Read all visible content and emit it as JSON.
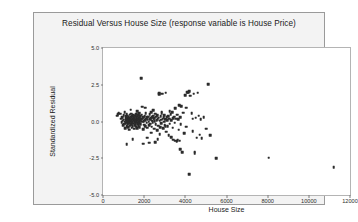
{
  "chart_data": {
    "type": "scatter",
    "title": "Residual Versus House Size (response variable is House Price)",
    "xlabel": "House Size",
    "ylabel": "Standardized Residual",
    "xlim": [
      0,
      12000
    ],
    "ylim": [
      -5.0,
      5.0
    ],
    "xticks": [
      0,
      2000,
      4000,
      6000,
      8000,
      10000,
      12000
    ],
    "xtick_labels": [
      "0",
      "2000",
      "4000",
      "6000",
      "8000",
      "10000",
      "12000"
    ],
    "yticks": [
      5.0,
      2.5,
      0.0,
      -2.5,
      -5.0
    ],
    "ytick_labels": [
      "5.0",
      "2.5",
      "0.0",
      "-2.5",
      "-5.0"
    ],
    "grid": false,
    "legend": null,
    "marker_color": "#2b2b2b",
    "marker_size_px": 2.6,
    "points": [
      [
        760,
        0.55
      ],
      [
        830,
        0.52
      ],
      [
        880,
        0.18
      ],
      [
        900,
        -0.05
      ],
      [
        940,
        0.3
      ],
      [
        960,
        0.05
      ],
      [
        980,
        -0.25
      ],
      [
        1000,
        0.42
      ],
      [
        1010,
        0.12
      ],
      [
        1030,
        -0.15
      ],
      [
        1050,
        0.62
      ],
      [
        1060,
        0.0
      ],
      [
        1080,
        -0.45
      ],
      [
        1100,
        0.22
      ],
      [
        1110,
        -0.1
      ],
      [
        1120,
        0.35
      ],
      [
        1140,
        0.08
      ],
      [
        1150,
        -0.3
      ],
      [
        1160,
        0.48
      ],
      [
        1170,
        0.15
      ],
      [
        1180,
        -0.05
      ],
      [
        1190,
        0.25
      ],
      [
        1200,
        -0.2
      ],
      [
        1210,
        0.4
      ],
      [
        1220,
        0.02
      ],
      [
        1230,
        -0.38
      ],
      [
        1240,
        0.18
      ],
      [
        1250,
        0.3
      ],
      [
        1260,
        -0.12
      ],
      [
        1270,
        0.08
      ],
      [
        1280,
        -0.55
      ],
      [
        1290,
        0.22
      ],
      [
        1300,
        0.45
      ],
      [
        1310,
        -0.02
      ],
      [
        1320,
        0.15
      ],
      [
        1330,
        -0.28
      ],
      [
        1340,
        0.33
      ],
      [
        1350,
        0.05
      ],
      [
        1360,
        -0.18
      ],
      [
        1370,
        0.52
      ],
      [
        1380,
        0.1
      ],
      [
        1390,
        -0.42
      ],
      [
        1400,
        0.28
      ],
      [
        1410,
        0.0
      ],
      [
        1420,
        0.38
      ],
      [
        1430,
        -0.08
      ],
      [
        1440,
        0.2
      ],
      [
        1450,
        -0.33
      ],
      [
        1460,
        0.12
      ],
      [
        1470,
        0.44
      ],
      [
        1480,
        -0.15
      ],
      [
        1490,
        0.06
      ],
      [
        1500,
        0.3
      ],
      [
        1510,
        -0.5
      ],
      [
        1520,
        0.16
      ],
      [
        1530,
        0.4
      ],
      [
        1540,
        -0.05
      ],
      [
        1550,
        0.24
      ],
      [
        1560,
        -0.25
      ],
      [
        1570,
        0.1
      ],
      [
        1580,
        0.35
      ],
      [
        1590,
        -0.12
      ],
      [
        1600,
        0.02
      ],
      [
        1610,
        0.5
      ],
      [
        1620,
        -0.35
      ],
      [
        1630,
        0.18
      ],
      [
        1640,
        0.28
      ],
      [
        1650,
        -0.08
      ],
      [
        1660,
        0.12
      ],
      [
        1670,
        -0.45
      ],
      [
        1680,
        0.32
      ],
      [
        1690,
        0.05
      ],
      [
        1700,
        -0.2
      ],
      [
        1710,
        0.42
      ],
      [
        1720,
        0.14
      ],
      [
        1730,
        -0.3
      ],
      [
        1740,
        0.22
      ],
      [
        1750,
        0.0
      ],
      [
        1760,
        0.55
      ],
      [
        1770,
        -0.1
      ],
      [
        1780,
        0.26
      ],
      [
        1790,
        -0.4
      ],
      [
        1800,
        0.08
      ],
      [
        1820,
        0.36
      ],
      [
        1840,
        -0.18
      ],
      [
        1860,
        0.16
      ],
      [
        1880,
        0.46
      ],
      [
        1900,
        -0.02
      ],
      [
        1920,
        0.2
      ],
      [
        1940,
        -0.52
      ],
      [
        1960,
        0.3
      ],
      [
        1980,
        0.04
      ],
      [
        2000,
        -0.22
      ],
      [
        2020,
        0.38
      ],
      [
        2040,
        0.1
      ],
      [
        2060,
        -0.3
      ],
      [
        2080,
        0.58
      ],
      [
        2100,
        0.18
      ],
      [
        2120,
        -0.08
      ],
      [
        2140,
        0.28
      ],
      [
        2160,
        -0.42
      ],
      [
        2180,
        0.12
      ],
      [
        2200,
        0.34
      ],
      [
        2220,
        0.0
      ],
      [
        2240,
        -0.25
      ],
      [
        2260,
        0.48
      ],
      [
        2280,
        0.14
      ],
      [
        2300,
        -0.15
      ],
      [
        2320,
        0.24
      ],
      [
        2340,
        0.62
      ],
      [
        2360,
        -0.35
      ],
      [
        2380,
        0.06
      ],
      [
        2400,
        0.3
      ],
      [
        2420,
        -0.05
      ],
      [
        2440,
        0.4
      ],
      [
        2460,
        0.18
      ],
      [
        2480,
        -0.48
      ],
      [
        2500,
        0.22
      ],
      [
        2520,
        0.02
      ],
      [
        2540,
        0.52
      ],
      [
        2560,
        -0.2
      ],
      [
        2580,
        0.32
      ],
      [
        2600,
        0.1
      ],
      [
        2620,
        -0.6
      ],
      [
        2640,
        0.44
      ],
      [
        2660,
        0.15
      ],
      [
        2680,
        -0.28
      ],
      [
        2700,
        0.26
      ],
      [
        2720,
        1.85
      ],
      [
        2740,
        1.92
      ],
      [
        2760,
        0.05
      ],
      [
        2780,
        -0.38
      ],
      [
        2800,
        0.36
      ],
      [
        2820,
        0.12
      ],
      [
        2840,
        -0.1
      ],
      [
        2860,
        0.55
      ],
      [
        2880,
        1.9
      ],
      [
        2900,
        0.2
      ],
      [
        2920,
        -0.45
      ],
      [
        2940,
        0.3
      ],
      [
        2960,
        0.0
      ],
      [
        2980,
        0.42
      ],
      [
        3000,
        -0.25
      ],
      [
        3020,
        0.16
      ],
      [
        3050,
        1.95
      ],
      [
        3080,
        -0.7
      ],
      [
        3100,
        0.28
      ],
      [
        3120,
        0.08
      ],
      [
        3150,
        -0.32
      ],
      [
        3180,
        0.38
      ],
      [
        3200,
        -0.95
      ],
      [
        3220,
        0.18
      ],
      [
        3250,
        -0.15
      ],
      [
        3280,
        0.48
      ],
      [
        3300,
        -1.05
      ],
      [
        3320,
        0.1
      ],
      [
        3350,
        0.62
      ],
      [
        3380,
        -0.42
      ],
      [
        3400,
        0.24
      ],
      [
        3420,
        -1.25
      ],
      [
        3450,
        0.34
      ],
      [
        3480,
        -0.08
      ],
      [
        3500,
        0.9
      ],
      [
        3520,
        -1.3
      ],
      [
        3550,
        0.2
      ],
      [
        3580,
        -1.35
      ],
      [
        3600,
        0.45
      ],
      [
        3620,
        -1.28
      ],
      [
        3650,
        0.14
      ],
      [
        3680,
        -0.55
      ],
      [
        3700,
        1.1
      ],
      [
        3720,
        -1.32
      ],
      [
        3750,
        0.3
      ],
      [
        3780,
        -0.2
      ],
      [
        3800,
        1.05
      ],
      [
        3850,
        -2.1
      ],
      [
        3900,
        0.6
      ],
      [
        3950,
        -0.8
      ],
      [
        4000,
        1.8
      ],
      [
        4050,
        -0.35
      ],
      [
        4100,
        2.0
      ],
      [
        4150,
        1.95
      ],
      [
        4180,
        2.05
      ],
      [
        4200,
        -3.6
      ],
      [
        4250,
        1.75
      ],
      [
        4300,
        0.55
      ],
      [
        4350,
        -0.65
      ],
      [
        4400,
        1.9
      ],
      [
        4450,
        -2.05
      ],
      [
        4500,
        0.25
      ],
      [
        4550,
        -1.1
      ],
      [
        4600,
        1.95
      ],
      [
        4650,
        0.4
      ],
      [
        4700,
        -0.9
      ],
      [
        4750,
        0.15
      ],
      [
        4800,
        -1.15
      ],
      [
        4900,
        0.3
      ],
      [
        5000,
        -0.5
      ],
      [
        5100,
        2.55
      ],
      [
        5200,
        -0.95
      ],
      [
        5500,
        -2.5
      ],
      [
        5950,
        5.4
      ],
      [
        8050,
        -2.45
      ],
      [
        11200,
        -3.1
      ],
      [
        1850,
        2.95
      ],
      [
        2250,
        -1.45
      ],
      [
        1950,
        -1.5
      ],
      [
        1150,
        -1.55
      ],
      [
        2550,
        -1.4
      ],
      [
        1450,
        -1.2
      ],
      [
        2750,
        -0.85
      ],
      [
        3050,
        -0.3
      ],
      [
        1650,
        0.7
      ],
      [
        2450,
        0.75
      ],
      [
        2850,
        0.68
      ],
      [
        3250,
        0.72
      ],
      [
        1350,
        0.8
      ],
      [
        2150,
        -1.1
      ],
      [
        2650,
        -1.2
      ],
      [
        3750,
        -1.9
      ],
      [
        4450,
        -2.15
      ],
      [
        680,
        0.4
      ],
      [
        720,
        0.48
      ],
      [
        1900,
        1.0
      ],
      [
        2050,
        0.95
      ],
      [
        2350,
        -0.75
      ],
      [
        4050,
        0.95
      ],
      [
        4350,
        0.2
      ]
    ]
  }
}
